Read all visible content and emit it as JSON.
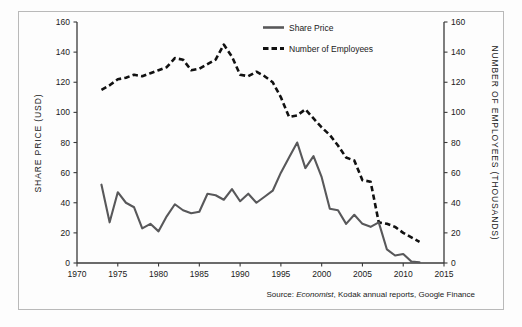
{
  "chart_data": {
    "type": "line",
    "title": "",
    "xlabel": "",
    "ylabel": "SHARE PRICE (USD)",
    "y2label": "NUMBER OF EMPLOYEES (THOUSANDS)",
    "xlim": [
      1970,
      2015
    ],
    "ylim": [
      0,
      160
    ],
    "y2lim": [
      0,
      160
    ],
    "grid": false,
    "legend_position": "top-right",
    "xticks": [
      1970,
      1975,
      1980,
      1985,
      1990,
      1995,
      2000,
      2005,
      2010,
      2015
    ],
    "yticks": [
      0,
      20,
      40,
      60,
      80,
      100,
      120,
      140,
      160
    ],
    "y2ticks": [
      0,
      20,
      40,
      60,
      80,
      100,
      120,
      140,
      160
    ],
    "series": [
      {
        "name": "Share Price",
        "axis": "left",
        "style": "solid",
        "color": "#58585a",
        "x": [
          1973,
          1974,
          1975,
          1976,
          1977,
          1978,
          1979,
          1980,
          1981,
          1982,
          1983,
          1984,
          1985,
          1986,
          1987,
          1988,
          1989,
          1990,
          1991,
          1992,
          1993,
          1994,
          1995,
          1996,
          1997,
          1998,
          1999,
          2000,
          2001,
          2002,
          2003,
          2004,
          2005,
          2006,
          2007,
          2008,
          2009,
          2010,
          2011,
          2012
        ],
        "values": [
          52,
          27,
          47,
          40,
          37,
          23,
          26,
          21,
          31,
          39,
          35,
          33,
          34,
          46,
          45,
          42,
          49,
          41,
          46,
          40,
          44,
          48,
          60,
          70,
          80,
          63,
          71,
          57,
          36,
          35,
          26,
          32,
          26,
          24,
          27,
          9,
          5,
          6,
          1,
          0.5
        ]
      },
      {
        "name": "Number of Employees",
        "axis": "right",
        "style": "dashed",
        "color": "#111111",
        "x": [
          1973,
          1974,
          1975,
          1976,
          1977,
          1978,
          1979,
          1980,
          1981,
          1982,
          1983,
          1984,
          1985,
          1986,
          1987,
          1988,
          1989,
          1990,
          1991,
          1992,
          1993,
          1994,
          1995,
          1996,
          1997,
          1998,
          1999,
          2000,
          2001,
          2002,
          2003,
          2004,
          2005,
          2006,
          2007,
          2008,
          2009,
          2010,
          2011,
          2012
        ],
        "values": [
          115,
          118,
          122,
          123,
          125,
          124,
          126,
          128,
          130,
          136,
          135,
          128,
          129,
          132,
          135,
          145,
          137,
          125,
          124,
          127,
          124,
          120,
          110,
          97,
          98,
          102,
          96,
          90,
          85,
          78,
          70,
          68,
          55,
          54,
          27,
          26,
          24,
          20,
          17,
          14
        ]
      }
    ],
    "annotations": [
      {
        "name": "source",
        "text_prefix": "Source: ",
        "text_emphasis": "Economist",
        "text_suffix": ", Kodak annual reports, Google Finance"
      }
    ]
  },
  "legend": {
    "items": [
      {
        "label": "Share Price",
        "marker": "solid-line"
      },
      {
        "label": "Number of Employees",
        "marker": "dashed-line"
      }
    ]
  },
  "axes": {
    "left_title": "SHARE PRICE (USD)",
    "right_title": "NUMBER OF EMPLOYEES (THOUSANDS)",
    "y_tick_labels": [
      "0",
      "20",
      "40",
      "60",
      "80",
      "100",
      "120",
      "140",
      "160"
    ],
    "y2_tick_labels": [
      "0",
      "20",
      "40",
      "60",
      "80",
      "100",
      "120",
      "140",
      "160"
    ],
    "x_tick_labels": [
      "1970",
      "1975",
      "1980",
      "1985",
      "1990",
      "1995",
      "2000",
      "2005",
      "2010",
      "2015"
    ]
  },
  "source": {
    "prefix": "Source: ",
    "emphasis": "Economist",
    "suffix": ", Kodak annual reports, Google Finance"
  }
}
